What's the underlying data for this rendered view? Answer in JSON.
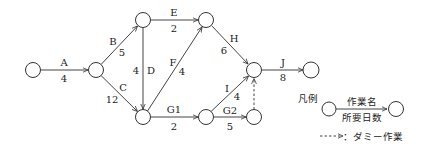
{
  "diagram": {
    "type": "arrow-diagram",
    "nodes": [
      {
        "id": "n1",
        "x": 33,
        "y": 70
      },
      {
        "id": "n2",
        "x": 96,
        "y": 70
      },
      {
        "id": "n3",
        "x": 143,
        "y": 20
      },
      {
        "id": "n4",
        "x": 143,
        "y": 117
      },
      {
        "id": "n5",
        "x": 206,
        "y": 20
      },
      {
        "id": "n6",
        "x": 206,
        "y": 117
      },
      {
        "id": "n7",
        "x": 254,
        "y": 70
      },
      {
        "id": "n8",
        "x": 254,
        "y": 117
      },
      {
        "id": "n9",
        "x": 311,
        "y": 70
      }
    ],
    "activities": [
      {
        "name": "A",
        "days": "4",
        "from": "n1",
        "to": "n2"
      },
      {
        "name": "B",
        "days": "5",
        "from": "n2",
        "to": "n3"
      },
      {
        "name": "C",
        "days": "12",
        "from": "n2",
        "to": "n4"
      },
      {
        "name": "D",
        "days": "4",
        "from": "n3",
        "to": "n4"
      },
      {
        "name": "E",
        "days": "2",
        "from": "n3",
        "to": "n5"
      },
      {
        "name": "F",
        "days": "4",
        "from": "n4",
        "to": "n5"
      },
      {
        "name": "G1",
        "days": "2",
        "from": "n4",
        "to": "n6"
      },
      {
        "name": "H",
        "days": "6",
        "from": "n5",
        "to": "n7"
      },
      {
        "name": "I",
        "days": "4",
        "from": "n6",
        "to": "n7"
      },
      {
        "name": "G2",
        "days": "5",
        "from": "n6",
        "to": "n8"
      },
      {
        "name": "J",
        "days": "8",
        "from": "n7",
        "to": "n9"
      }
    ],
    "dummies": [
      {
        "from": "n8",
        "to": "n7"
      }
    ]
  },
  "legend": {
    "title": "凡例",
    "activity_name": "作業名",
    "duration": "所要日数",
    "dummy_label": "：ダミー作業"
  }
}
